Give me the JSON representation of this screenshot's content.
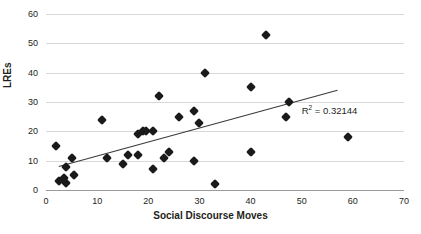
{
  "chart_data": {
    "type": "scatter",
    "title": "",
    "xlabel": "Social Discourse Moves",
    "ylabel": "LREs",
    "xlim": [
      0,
      70
    ],
    "ylim": [
      0,
      60
    ],
    "xticks": [
      0,
      10,
      20,
      30,
      40,
      50,
      60,
      70
    ],
    "yticks": [
      0,
      10,
      20,
      30,
      40,
      50,
      60
    ],
    "grid": "horizontal",
    "legend": "none",
    "marker": "diamond",
    "marker_color": "#1a1a1a",
    "gridline_color": "#d8d8d8",
    "axis_color": "#9a9a9a",
    "trendline": {
      "color": "#3a3a3a",
      "x_start": 2.5,
      "y_start": 8.0,
      "x_end": 57.0,
      "y_end": 34.0
    },
    "annotation": {
      "r_squared_prefix": "R",
      "r_squared_exponent": "2",
      "r_squared_text": " = 0.32144",
      "value": 0.32144,
      "x": 50.0,
      "y": 27.0
    },
    "points": [
      {
        "x": 2,
        "y": 15
      },
      {
        "x": 2.5,
        "y": 3
      },
      {
        "x": 3.5,
        "y": 4
      },
      {
        "x": 4,
        "y": 8
      },
      {
        "x": 4,
        "y": 2.5
      },
      {
        "x": 5,
        "y": 11
      },
      {
        "x": 5.5,
        "y": 5
      },
      {
        "x": 11,
        "y": 24
      },
      {
        "x": 12,
        "y": 11
      },
      {
        "x": 15,
        "y": 9
      },
      {
        "x": 16,
        "y": 12
      },
      {
        "x": 18,
        "y": 19
      },
      {
        "x": 18,
        "y": 12
      },
      {
        "x": 19,
        "y": 20
      },
      {
        "x": 19.5,
        "y": 20
      },
      {
        "x": 21,
        "y": 20
      },
      {
        "x": 21,
        "y": 7
      },
      {
        "x": 22,
        "y": 32
      },
      {
        "x": 23,
        "y": 11
      },
      {
        "x": 24,
        "y": 13
      },
      {
        "x": 26,
        "y": 25
      },
      {
        "x": 29,
        "y": 27
      },
      {
        "x": 29,
        "y": 10
      },
      {
        "x": 30,
        "y": 23
      },
      {
        "x": 31,
        "y": 40
      },
      {
        "x": 33,
        "y": 2
      },
      {
        "x": 40,
        "y": 35
      },
      {
        "x": 40,
        "y": 13
      },
      {
        "x": 43,
        "y": 53
      },
      {
        "x": 47,
        "y": 25
      },
      {
        "x": 47.5,
        "y": 30
      },
      {
        "x": 59,
        "y": 18
      }
    ]
  }
}
